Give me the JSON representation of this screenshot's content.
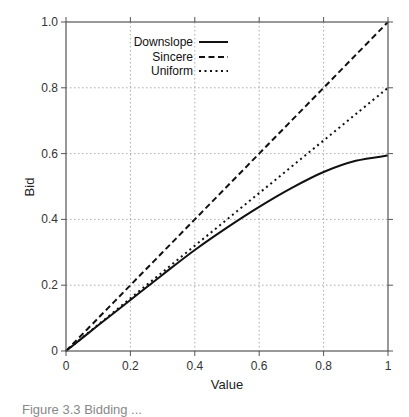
{
  "chart_data": {
    "type": "line",
    "title": "",
    "xlabel": "Value",
    "ylabel": "Bid",
    "xlim": [
      0,
      1
    ],
    "ylim": [
      0,
      1.0
    ],
    "xticks": [
      "0",
      "0.2",
      "0.4",
      "0.6",
      "0.8",
      "1"
    ],
    "yticks": [
      "0",
      "0.2",
      "0.4",
      "0.6",
      "0.8",
      "1.0"
    ],
    "grid": true,
    "legend_position": "upper-left-inside",
    "x": [
      0,
      0.1,
      0.2,
      0.3,
      0.4,
      0.5,
      0.6,
      0.7,
      0.8,
      0.9,
      1.0
    ],
    "series": [
      {
        "name": "Downslope",
        "style": "solid",
        "values": [
          0,
          0.078,
          0.155,
          0.232,
          0.307,
          0.375,
          0.438,
          0.495,
          0.544,
          0.578,
          0.594
        ]
      },
      {
        "name": "Sincere",
        "style": "dashed",
        "values": [
          0,
          0.1,
          0.2,
          0.3,
          0.4,
          0.5,
          0.6,
          0.7,
          0.8,
          0.9,
          1.0
        ]
      },
      {
        "name": "Uniform",
        "style": "dotted",
        "values": [
          0,
          0.08,
          0.16,
          0.24,
          0.32,
          0.4,
          0.48,
          0.56,
          0.64,
          0.72,
          0.8
        ]
      }
    ]
  },
  "caption": "Figure 3.3 Bidding ..."
}
